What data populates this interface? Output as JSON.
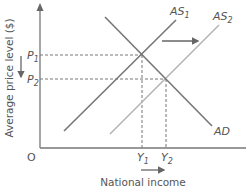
{
  "diagram": {
    "y_axis_label": "Average price level ($)",
    "x_axis_label": "National income",
    "origin_label": "O",
    "curves": [
      {
        "name": "AS",
        "sub": "1",
        "color": "#777777"
      },
      {
        "name": "AS",
        "sub": "2",
        "color": "#b3b3b3"
      },
      {
        "name": "AD",
        "sub": "",
        "color": "#777777"
      }
    ],
    "price_levels": [
      {
        "name": "P",
        "sub": "1"
      },
      {
        "name": "P",
        "sub": "2"
      }
    ],
    "income_levels": [
      {
        "name": "Y",
        "sub": "1"
      },
      {
        "name": "Y",
        "sub": "2"
      }
    ],
    "arrows": {
      "supply_shift": "right",
      "price_change": "down",
      "income_change": "right"
    }
  }
}
